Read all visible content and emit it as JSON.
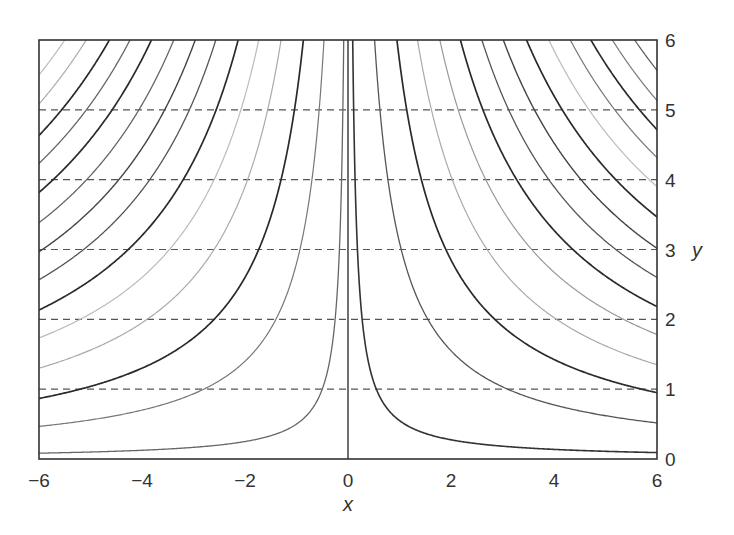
{
  "chart_data": {
    "type": "line",
    "title": "",
    "xlabel": "x",
    "ylabel": "y",
    "xlim": [
      -6,
      6
    ],
    "ylim": [
      0,
      6
    ],
    "x_ticks": [
      -6,
      -4,
      -2,
      0,
      2,
      4,
      6
    ],
    "x_tick_labels": [
      "−6",
      "−4",
      "−2",
      "0",
      "2",
      "4",
      "6"
    ],
    "y_ticks": [
      0,
      1,
      2,
      3,
      4,
      5,
      6
    ],
    "y_tick_labels": [
      "0",
      "1",
      "2",
      "3",
      "4",
      "5",
      "6"
    ],
    "y_axis_position": "right",
    "grid": {
      "horizontal_dashed_at_y": [
        1,
        2,
        3,
        4,
        5
      ],
      "vertical": false
    },
    "legend": null,
    "vertical_line_x": 0,
    "series": [
      {
        "name": "right_c0.55",
        "side": "right",
        "c": 0.55,
        "color": "#333333",
        "width": 1.6
      },
      {
        "name": "right_c3.1",
        "side": "right",
        "c": 3.1,
        "color": "#555555",
        "width": 1.3
      },
      {
        "name": "right_c5.7",
        "side": "right",
        "c": 5.7,
        "color": "#2a2a2a",
        "width": 1.7
      },
      {
        "name": "right_c8.1",
        "side": "right",
        "c": 8.1,
        "color": "#aaaaaa",
        "width": 1.2
      },
      {
        "name": "right_c10.7",
        "side": "right",
        "c": 10.7,
        "color": "#999999",
        "width": 1.2
      },
      {
        "name": "right_c13.1",
        "side": "right",
        "c": 13.1,
        "color": "#2a2a2a",
        "width": 1.7
      },
      {
        "name": "right_c15.6",
        "side": "right",
        "c": 15.6,
        "color": "#555555",
        "width": 1.3
      },
      {
        "name": "right_c18.1",
        "side": "right",
        "c": 18.1,
        "color": "#444444",
        "width": 1.4
      },
      {
        "name": "right_c20.8",
        "side": "right",
        "c": 20.8,
        "color": "#2a2a2a",
        "width": 1.7
      },
      {
        "name": "right_c23.4",
        "side": "right",
        "c": 23.4,
        "color": "#bbbbbb",
        "width": 1.2
      },
      {
        "name": "right_c25.9",
        "side": "right",
        "c": 25.9,
        "color": "#777777",
        "width": 1.2
      },
      {
        "name": "right_c28.3",
        "side": "right",
        "c": 28.3,
        "color": "#2a2a2a",
        "width": 1.7
      },
      {
        "name": "right_c30.8",
        "side": "right",
        "c": 30.8,
        "color": "#777777",
        "width": 1.2
      },
      {
        "name": "right_c33.4",
        "side": "right",
        "c": 33.4,
        "color": "#555555",
        "width": 1.2
      },
      {
        "name": "left_c0.5",
        "side": "left",
        "c": 0.5,
        "color": "#666666",
        "width": 1.3
      },
      {
        "name": "left_c2.8",
        "side": "left",
        "c": 2.8,
        "color": "#777777",
        "width": 1.2
      },
      {
        "name": "left_c5.2",
        "side": "left",
        "c": 5.2,
        "color": "#2a2a2a",
        "width": 1.7
      },
      {
        "name": "left_c7.8",
        "side": "left",
        "c": 7.8,
        "color": "#aaaaaa",
        "width": 1.2
      },
      {
        "name": "left_c10.4",
        "side": "left",
        "c": 10.4,
        "color": "#bbbbbb",
        "width": 1.2
      },
      {
        "name": "left_c12.8",
        "side": "left",
        "c": 12.8,
        "color": "#2a2a2a",
        "width": 1.7
      },
      {
        "name": "left_c15.4",
        "side": "left",
        "c": 15.4,
        "color": "#555555",
        "width": 1.3
      },
      {
        "name": "left_c17.8",
        "side": "left",
        "c": 17.8,
        "color": "#444444",
        "width": 1.4
      },
      {
        "name": "left_c20.3",
        "side": "left",
        "c": 20.3,
        "color": "#666666",
        "width": 1.3
      },
      {
        "name": "left_c22.9",
        "side": "left",
        "c": 22.9,
        "color": "#2a2a2a",
        "width": 1.7
      },
      {
        "name": "left_c25.4",
        "side": "left",
        "c": 25.4,
        "color": "#666666",
        "width": 1.3
      },
      {
        "name": "left_c27.8",
        "side": "left",
        "c": 27.8,
        "color": "#2a2a2a",
        "width": 1.7
      },
      {
        "name": "left_c30.5",
        "side": "left",
        "c": 30.5,
        "color": "#aaaaaa",
        "width": 1.2
      },
      {
        "name": "left_c33.0",
        "side": "left",
        "c": 33.0,
        "color": "#bbbbbb",
        "width": 1.2
      }
    ]
  }
}
